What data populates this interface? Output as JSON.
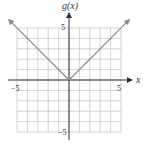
{
  "chart_data": {
    "type": "line",
    "title": "",
    "function": "g(x) = |x|",
    "xlabel": "x",
    "ylabel": "g(x)",
    "xlim": [
      -5,
      5
    ],
    "ylim": [
      -5,
      5
    ],
    "grid": true,
    "grid_step": 1,
    "xticks_labeled": [
      {
        "value": -5,
        "label": "−5"
      },
      {
        "value": 5,
        "label": "5"
      }
    ],
    "yticks_labeled": [
      {
        "value": 5,
        "label": "5"
      },
      {
        "value": -5,
        "label": "−5"
      }
    ],
    "series": [
      {
        "name": "g(x)",
        "points": [
          [
            -5.8,
            5.8
          ],
          [
            0,
            0
          ],
          [
            5.8,
            5.8
          ]
        ],
        "arrows_both_ends": true
      }
    ]
  },
  "labels": {
    "y_axis": "g(x)",
    "x_axis": "x",
    "x_neg5": "−5",
    "x_pos5": "5",
    "y_pos5": "5",
    "y_neg5": "−5"
  },
  "colors": {
    "grid": "#c8c8c8",
    "axis": "#333333",
    "curve": "#8a8a8a"
  }
}
